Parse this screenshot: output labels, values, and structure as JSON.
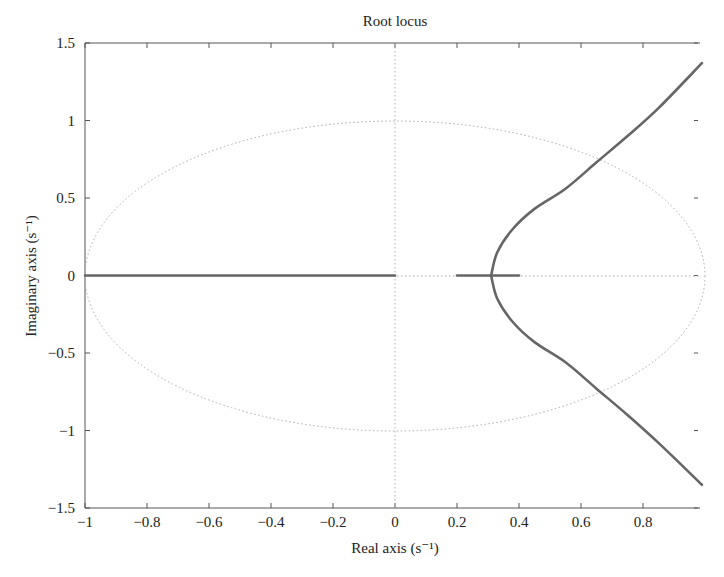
{
  "chart_data": {
    "type": "line",
    "title": "Root locus",
    "xlabel": "Real axis (s⁻¹)",
    "ylabel": "Imaginary axis (s⁻¹)",
    "xlim": [
      -1,
      1
    ],
    "ylim": [
      -1.5,
      1.5
    ],
    "xticks": [
      -1,
      -0.8,
      -0.6,
      -0.4,
      -0.2,
      0,
      0.2,
      0.4,
      0.6,
      0.8
    ],
    "xtick_labels": [
      "−1",
      "−0.8",
      "−0.6",
      "−0.4",
      "−0.2",
      "0",
      "0.2",
      "0.4",
      "0.6",
      "0.8"
    ],
    "yticks": [
      1.5,
      1,
      0.5,
      0,
      -0.5,
      -1,
      -1.5
    ],
    "ytick_labels": [
      "1.5",
      "1",
      "0.5",
      "0",
      "−0.5",
      "−1",
      "−1.5"
    ],
    "grid": false,
    "reference": {
      "unit_circle": true,
      "style": "dotted",
      "zero_axes": true
    },
    "series": [
      {
        "name": "real-axis-segment-1",
        "x": [
          -1,
          0
        ],
        "y": [
          0,
          0
        ]
      },
      {
        "name": "real-axis-segment-2",
        "x": [
          0.2,
          0.4
        ],
        "y": [
          0,
          0
        ]
      },
      {
        "name": "upper-branch",
        "x": [
          0.31,
          0.33,
          0.38,
          0.45,
          0.55,
          0.65,
          0.75,
          0.85,
          0.99
        ],
        "y": [
          0,
          0.15,
          0.3,
          0.43,
          0.56,
          0.73,
          0.9,
          1.08,
          1.37
        ]
      },
      {
        "name": "lower-branch",
        "x": [
          0.31,
          0.33,
          0.38,
          0.45,
          0.55,
          0.65,
          0.75,
          0.85,
          0.99
        ],
        "y": [
          0,
          -0.15,
          -0.3,
          -0.43,
          -0.56,
          -0.73,
          -0.9,
          -1.08,
          -1.35
        ]
      }
    ],
    "breakaway_point": {
      "x": 0.31,
      "y": 0
    }
  }
}
